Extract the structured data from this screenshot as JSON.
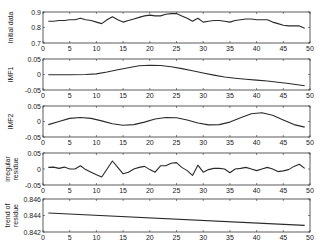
{
  "chart_data": [
    {
      "type": "line",
      "ylabel": "Initial data",
      "xlim": [
        0,
        50
      ],
      "ylim": [
        0.7,
        0.9
      ],
      "xticks": [
        0,
        5,
        10,
        15,
        20,
        25,
        30,
        35,
        40,
        45,
        50
      ],
      "yticks": [
        0.7,
        0.8,
        0.9
      ],
      "ytick_labels": [
        "0.7",
        "0.8",
        "0.9"
      ],
      "x": [
        1,
        2,
        3,
        4,
        5,
        6,
        7,
        8,
        9,
        10,
        11,
        12,
        13,
        14,
        15,
        16,
        17,
        18,
        19,
        20,
        21,
        22,
        23,
        24,
        25,
        26,
        27,
        28,
        29,
        30,
        31,
        32,
        33,
        34,
        35,
        36,
        37,
        38,
        39,
        40,
        41,
        42,
        43,
        44,
        45,
        46,
        47,
        48,
        49
      ],
      "values": [
        0.84,
        0.84,
        0.845,
        0.845,
        0.85,
        0.85,
        0.86,
        0.85,
        0.845,
        0.835,
        0.825,
        0.85,
        0.87,
        0.85,
        0.835,
        0.845,
        0.855,
        0.865,
        0.875,
        0.88,
        0.875,
        0.875,
        0.885,
        0.89,
        0.89,
        0.875,
        0.86,
        0.84,
        0.86,
        0.835,
        0.84,
        0.845,
        0.845,
        0.84,
        0.835,
        0.845,
        0.85,
        0.855,
        0.855,
        0.85,
        0.85,
        0.85,
        0.835,
        0.825,
        0.815,
        0.81,
        0.81,
        0.81,
        0.795
      ]
    },
    {
      "type": "line",
      "ylabel": "IMF1",
      "xlim": [
        0,
        50
      ],
      "ylim": [
        -0.05,
        0.05
      ],
      "xticks": [
        0,
        5,
        10,
        15,
        20,
        25,
        30,
        35,
        40,
        45,
        50
      ],
      "yticks": [
        -0.05,
        0,
        0.05
      ],
      "ytick_labels": [
        "-0.05",
        "0",
        "0.05"
      ],
      "x": [
        1,
        5,
        8,
        10,
        12,
        14,
        16,
        18,
        20,
        22,
        24,
        26,
        28,
        30,
        32,
        34,
        36,
        38,
        40,
        42,
        44,
        46,
        48,
        49
      ],
      "values": [
        -0.001,
        -0.001,
        0.0,
        0.002,
        0.008,
        0.015,
        0.022,
        0.028,
        0.03,
        0.029,
        0.025,
        0.019,
        0.012,
        0.005,
        -0.002,
        -0.008,
        -0.012,
        -0.015,
        -0.018,
        -0.021,
        -0.025,
        -0.029,
        -0.034,
        -0.036
      ]
    },
    {
      "type": "line",
      "ylabel": "IMF2",
      "xlim": [
        0,
        50
      ],
      "ylim": [
        -0.05,
        0.05
      ],
      "xticks": [
        0,
        5,
        10,
        15,
        20,
        25,
        30,
        35,
        40,
        45,
        50
      ],
      "yticks": [
        -0.05,
        0,
        0.05
      ],
      "ytick_labels": [
        "-0.05",
        "0",
        "0.05"
      ],
      "x": [
        1,
        3,
        5,
        7,
        9,
        11,
        13,
        15,
        17,
        19,
        21,
        23,
        25,
        27,
        29,
        31,
        33,
        35,
        37,
        39,
        41,
        43,
        45,
        47,
        49
      ],
      "values": [
        -0.01,
        0.0,
        0.01,
        0.013,
        0.01,
        0.002,
        -0.007,
        -0.012,
        -0.01,
        -0.002,
        0.008,
        0.013,
        0.012,
        0.005,
        -0.005,
        -0.011,
        -0.01,
        -0.002,
        0.012,
        0.025,
        0.028,
        0.02,
        0.005,
        -0.01,
        -0.018
      ]
    },
    {
      "type": "line",
      "ylabel": "irregular residue",
      "xlim": [
        0,
        50
      ],
      "ylim": [
        -0.05,
        0.05
      ],
      "xticks": [
        0,
        5,
        10,
        15,
        20,
        25,
        30,
        35,
        40,
        45,
        50
      ],
      "yticks": [
        -0.05,
        0,
        0.05
      ],
      "ytick_labels": [
        "-0.05",
        "0",
        "0.05"
      ],
      "x": [
        1,
        2,
        3,
        4,
        5,
        6,
        7,
        8,
        9,
        10,
        11,
        12,
        13,
        14,
        15,
        16,
        17,
        18,
        19,
        20,
        21,
        22,
        23,
        24,
        25,
        26,
        27,
        28,
        29,
        30,
        31,
        32,
        33,
        34,
        35,
        36,
        37,
        38,
        39,
        40,
        41,
        42,
        43,
        44,
        45,
        46,
        47,
        48,
        49
      ],
      "values": [
        0.005,
        0.006,
        0.002,
        0.006,
        0.0,
        0.0,
        0.01,
        -0.002,
        -0.01,
        -0.018,
        -0.025,
        0.0,
        0.025,
        0.005,
        -0.015,
        -0.01,
        0.0,
        0.005,
        0.008,
        -0.002,
        -0.01,
        0.01,
        0.01,
        0.018,
        0.02,
        0.005,
        -0.005,
        -0.02,
        0.012,
        -0.01,
        -0.002,
        0.002,
        0.002,
        0.0,
        -0.012,
        0.0,
        0.002,
        0.005,
        0.0,
        -0.005,
        0.0,
        0.005,
        0.0,
        -0.008,
        -0.006,
        -0.002,
        0.008,
        0.015,
        0.002
      ]
    },
    {
      "type": "line",
      "ylabel": "trend of residue",
      "xlim": [
        0,
        50
      ],
      "ylim": [
        0.842,
        0.846
      ],
      "xticks": [
        0,
        5,
        10,
        15,
        20,
        25,
        30,
        35,
        40,
        45,
        50
      ],
      "yticks": [
        0.842,
        0.844,
        0.846
      ],
      "ytick_labels": [
        "0.842",
        "0.844",
        "0.846"
      ],
      "x": [
        1,
        49
      ],
      "values": [
        0.8443,
        0.8428
      ]
    }
  ],
  "axis_color": "#333333",
  "line_color": "#2a2a2a"
}
